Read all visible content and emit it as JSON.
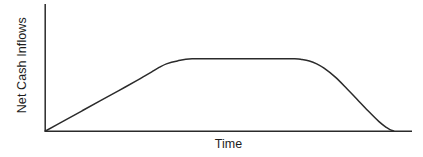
{
  "chart_data": {
    "type": "line",
    "title": "",
    "subtitle": "",
    "xlabel": "Time",
    "ylabel": "Net Cash Inflows",
    "xlim": [
      0,
      100
    ],
    "ylim": [
      0,
      100
    ],
    "grid": false,
    "legend": null,
    "xticks": [],
    "yticks": [],
    "xticklabels": [],
    "yticklabels": [],
    "annotations": [],
    "series": [
      {
        "name": "Net Cash Inflows",
        "color": "#2b2b2b",
        "linewidth": 1.5,
        "description": "Trapezoidal product life-cycle curve: linear growth from zero, flat plateau at maximum, then smooth S-shaped decline back to zero",
        "x": [
          0,
          5,
          10,
          15,
          20,
          25,
          27,
          29,
          31,
          33,
          36,
          40,
          50,
          60,
          68,
          70,
          72,
          74,
          76,
          79,
          82,
          85,
          88,
          91,
          93,
          94,
          95
        ],
        "y": [
          0,
          14,
          28,
          42,
          56,
          70,
          76,
          82,
          88,
          93,
          97,
          100,
          100,
          100,
          100,
          99,
          97,
          93,
          87,
          75,
          60,
          44,
          28,
          13,
          5,
          2,
          0
        ]
      }
    ],
    "axes": {
      "spines": [
        "left",
        "bottom"
      ],
      "spine_color": "#2b2b2b",
      "spine_width": 1.5,
      "background": "#ffffff"
    },
    "phases": [
      {
        "name": "growth",
        "x_start": 0,
        "x_end": 36
      },
      {
        "name": "maturity",
        "x_start": 36,
        "x_end": 70
      },
      {
        "name": "decline",
        "x_start": 70,
        "x_end": 95
      }
    ]
  },
  "figure": {
    "background": "#ffffff",
    "ylabel": "Net Cash Inflows",
    "xlabel": "Time"
  }
}
